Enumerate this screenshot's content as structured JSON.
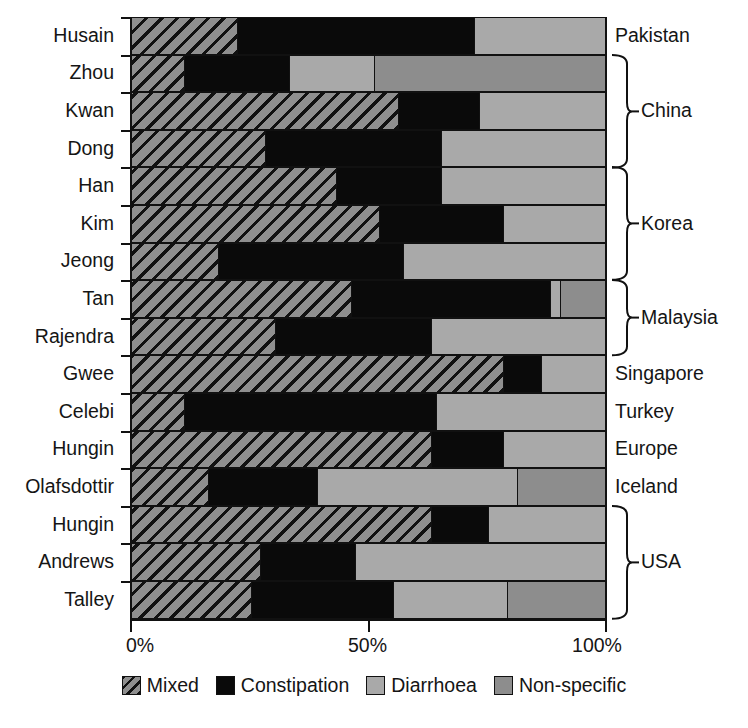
{
  "chart_data": {
    "type": "bar",
    "subtype": "horizontal-stacked-100-percent",
    "title": "",
    "xlabel": "",
    "ylabel": "",
    "xlim": [
      0,
      100
    ],
    "xticks": [
      0,
      50,
      100
    ],
    "xtick_labels": [
      "0%",
      "50%",
      "100%"
    ],
    "grid": false,
    "legend_position": "bottom-center",
    "categories": [
      "Husain",
      "Zhou",
      "Kwan",
      "Dong",
      "Han",
      "Kim",
      "Jeong",
      "Tan",
      "Rajendra",
      "Gwee",
      "Celebi",
      "Hungin",
      "Olafsdottir",
      "Hungin",
      "Andrews",
      "Talley"
    ],
    "series": [
      {
        "name": "Mixed",
        "color": "#8f8f8f",
        "pattern": "diagonal-hatch",
        "values": [
          22,
          11,
          56,
          28,
          43,
          52,
          18,
          46,
          30,
          78,
          11,
          63,
          16,
          63,
          27,
          25
        ]
      },
      {
        "name": "Constipation",
        "color": "#0a0a0a",
        "pattern": "solid",
        "values": [
          50,
          22,
          17,
          37,
          22,
          26,
          39,
          42,
          33,
          8,
          53,
          15,
          23,
          12,
          20,
          30
        ]
      },
      {
        "name": "Diarrhoea",
        "color": "#a9a9a9",
        "pattern": "solid",
        "values": [
          28,
          18,
          27,
          35,
          35,
          22,
          43,
          2,
          37,
          14,
          36,
          22,
          42,
          25,
          53,
          24
        ]
      },
      {
        "name": "Non-specific",
        "color": "#8d8d8d",
        "pattern": "solid",
        "values": [
          0,
          49,
          0,
          0,
          0,
          0,
          0,
          10,
          0,
          0,
          0,
          0,
          19,
          0,
          0,
          21
        ]
      }
    ],
    "country_groups": [
      {
        "label": "Pakistan",
        "first_row": 0,
        "last_row": 0,
        "bracket": false
      },
      {
        "label": "China",
        "first_row": 1,
        "last_row": 3,
        "bracket": true
      },
      {
        "label": "Korea",
        "first_row": 4,
        "last_row": 6,
        "bracket": true
      },
      {
        "label": "Malaysia",
        "first_row": 7,
        "last_row": 8,
        "bracket": true
      },
      {
        "label": "Singapore",
        "first_row": 9,
        "last_row": 9,
        "bracket": false
      },
      {
        "label": "Turkey",
        "first_row": 10,
        "last_row": 10,
        "bracket": false
      },
      {
        "label": "Europe",
        "first_row": 11,
        "last_row": 11,
        "bracket": false
      },
      {
        "label": "Iceland",
        "first_row": 12,
        "last_row": 12,
        "bracket": false
      },
      {
        "label": "USA",
        "first_row": 13,
        "last_row": 15,
        "bracket": true
      }
    ]
  },
  "study_labels": {
    "0": "Husain",
    "1": "Zhou",
    "2": "Kwan",
    "3": "Dong",
    "4": "Han",
    "5": "Kim",
    "6": "Jeong",
    "7": "Tan",
    "8": "Rajendra",
    "9": "Gwee",
    "10": "Celebi",
    "11": "Hungin",
    "12": "Olafsdottir",
    "13": "Hungin",
    "14": "Andrews",
    "15": "Talley"
  },
  "axis": {
    "x_tick_labels": [
      "0%",
      "50%",
      "100%"
    ]
  },
  "legend": {
    "items": [
      {
        "label": "Mixed",
        "swatch": "mixed-hatch-swatch"
      },
      {
        "label": "Constipation",
        "swatch": "constipation-black-swatch"
      },
      {
        "label": "Diarrhoea",
        "swatch": "diarrhoea-gray-swatch"
      },
      {
        "label": "Non-specific",
        "swatch": "non-specific-gray-swatch"
      }
    ]
  },
  "colors": {
    "mixed": "#8f8f8f",
    "constipation": "#0a0a0a",
    "diarrhoea": "#a9a9a9",
    "non_specific": "#8d8d8d",
    "axis": "#111111",
    "background": "#ffffff"
  }
}
